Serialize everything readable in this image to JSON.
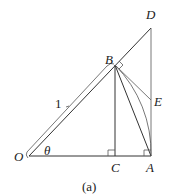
{
  "figure": {
    "caption": "(a)",
    "points": {
      "O": {
        "label": "O",
        "x": 29,
        "y": 156
      },
      "A": {
        "label": "A",
        "x": 151,
        "y": 156
      },
      "C": {
        "label": "C",
        "x": 115,
        "y": 156
      },
      "B": {
        "label": "B",
        "x": 115,
        "y": 65
      },
      "D": {
        "label": "D",
        "x": 151,
        "y": 28
      },
      "E": {
        "label": "E",
        "x": 151,
        "y": 100
      }
    },
    "angle_label": "θ",
    "length_label": "1",
    "stroke_color": "#333333"
  }
}
